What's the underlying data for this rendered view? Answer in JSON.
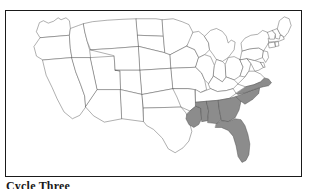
{
  "figure": {
    "caption": "Cycle Three",
    "frame_color": "#1a1a1a",
    "background_color": "#ffffff"
  },
  "map": {
    "title": "United States map",
    "projection_note": "contiguous 48 states, state outlines only",
    "outline_color": "#4a4a4a",
    "unshaded_fill": "#ffffff",
    "shaded_fill": "#8c8c8c",
    "shaded_states": [
      "Louisiana",
      "Mississippi",
      "Alabama",
      "Georgia",
      "Florida",
      "South Carolina",
      "North Carolina"
    ],
    "unshaded_states": [
      "Washington",
      "Oregon",
      "California",
      "Idaho",
      "Nevada",
      "Utah",
      "Arizona",
      "Montana",
      "Wyoming",
      "Colorado",
      "New Mexico",
      "North Dakota",
      "South Dakota",
      "Nebraska",
      "Kansas",
      "Oklahoma",
      "Texas",
      "Minnesota",
      "Iowa",
      "Missouri",
      "Arkansas",
      "Wisconsin",
      "Illinois",
      "Michigan",
      "Indiana",
      "Ohio",
      "Kentucky",
      "Tennessee",
      "West Virginia",
      "Virginia",
      "Maryland",
      "Delaware",
      "Pennsylvania",
      "New Jersey",
      "New York",
      "Connecticut",
      "Rhode Island",
      "Massachusetts",
      "Vermont",
      "New Hampshire",
      "Maine"
    ]
  }
}
